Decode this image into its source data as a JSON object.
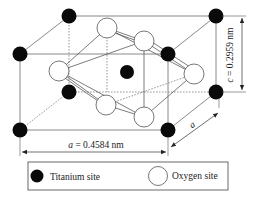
{
  "dimensions": {
    "a_label_italic": "a",
    "a_value": " = 0.4584 nm",
    "c_label_italic": "c",
    "c_value": " = 0.2959 nm",
    "depth_label": "a"
  },
  "legend": {
    "items": [
      {
        "label": "Titanium site",
        "symbol": "filled-circle",
        "color": "#0a0a0a"
      },
      {
        "label": "Oxygen site",
        "symbol": "open-circle",
        "color": "#ffffff"
      }
    ]
  },
  "atoms": {
    "titanium": [
      {
        "id": "ti-back-top-left",
        "x": 69,
        "y": 16
      },
      {
        "id": "ti-back-top-right",
        "x": 216,
        "y": 16
      },
      {
        "id": "ti-front-top-left",
        "x": 20,
        "y": 54
      },
      {
        "id": "ti-front-top-right",
        "x": 168,
        "y": 54
      },
      {
        "id": "ti-body-center",
        "x": 127,
        "y": 72
      },
      {
        "id": "ti-back-bottom-left",
        "x": 69,
        "y": 92
      },
      {
        "id": "ti-back-bottom-right",
        "x": 216,
        "y": 92
      },
      {
        "id": "ti-front-bottom-left",
        "x": 20,
        "y": 130
      },
      {
        "id": "ti-front-bottom-right",
        "x": 168,
        "y": 130
      }
    ],
    "oxygen": [
      {
        "id": "o-top-back",
        "x": 107,
        "y": 28
      },
      {
        "id": "o-top-front",
        "x": 144,
        "y": 41
      },
      {
        "id": "o-left",
        "x": 59,
        "y": 71
      },
      {
        "id": "o-right",
        "x": 194,
        "y": 74
      },
      {
        "id": "o-bottom-back",
        "x": 106,
        "y": 105
      },
      {
        "id": "o-bottom-front",
        "x": 144,
        "y": 117
      }
    ]
  },
  "colors": {
    "titanium": "#0a0a0a",
    "oxygen_fill": "#ffffff",
    "line": "#6b6b6b"
  }
}
